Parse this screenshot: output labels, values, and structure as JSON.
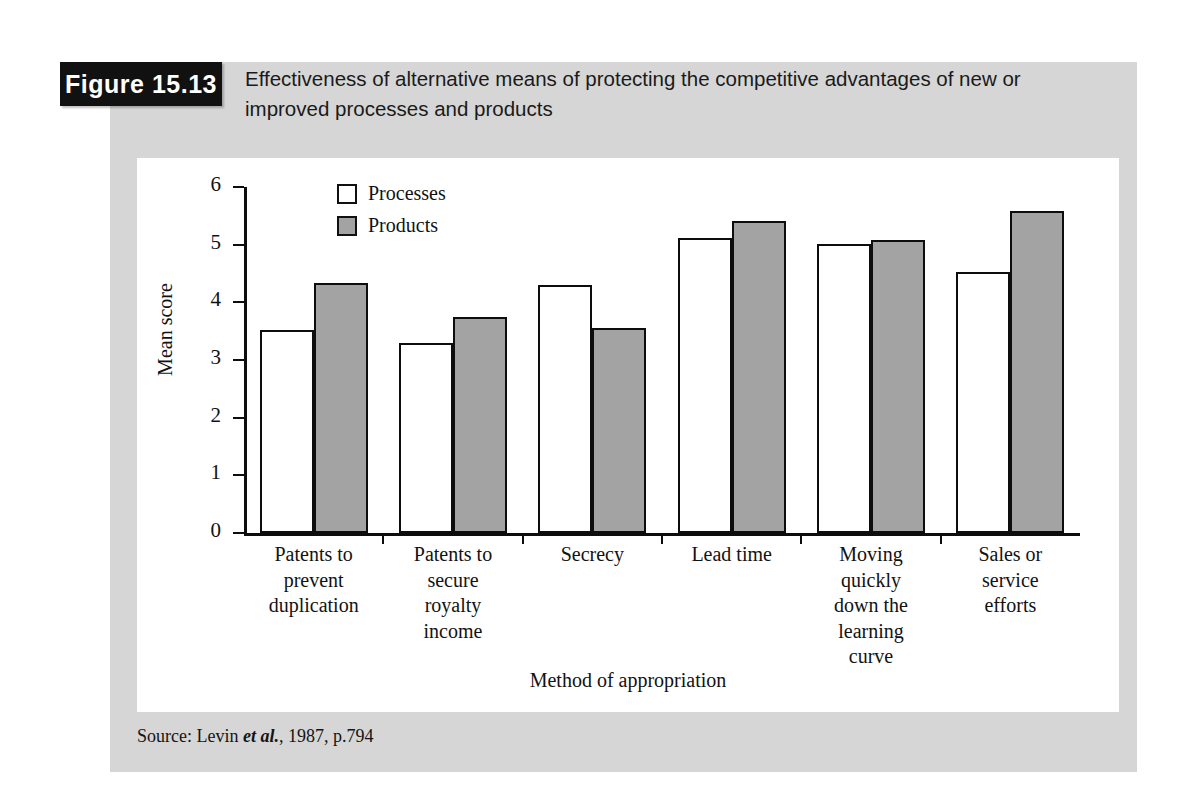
{
  "figure": {
    "number_label": "Figure 15.13",
    "caption": "Effectiveness of alternative means of protecting the competitive advantages of new or improved processes and products",
    "source_prefix": "Source: Levin ",
    "source_italic": "et al.",
    "source_suffix": ", 1987, p.794"
  },
  "colors": {
    "figure_background": "#d6d6d6",
    "panel_background": "#ffffff",
    "tab_background": "#111111",
    "tab_text": "#ffffff",
    "processes_fill": "#ffffff",
    "products_fill": "#a3a3a3",
    "bar_outline": "#0d0d0d",
    "axis": "#0d0d0d",
    "text": "#121212"
  },
  "chart_data": {
    "type": "bar",
    "title": "Effectiveness of alternative means of protecting the competitive advantages of new or improved processes and products",
    "xlabel": "Method of appropriation",
    "ylabel": "Mean score",
    "ylim": [
      0,
      6
    ],
    "yticks": [
      0,
      1,
      2,
      3,
      4,
      5,
      6
    ],
    "ytick_labels": [
      "0",
      "1",
      "2",
      "3",
      "4",
      "5",
      "6"
    ],
    "grid": false,
    "legend_position": "top-left-inside",
    "categories": [
      "Patents to prevent duplication",
      "Patents to secure royalty income",
      "Secrecy",
      "Lead time",
      "Moving quickly down the learning curve",
      "Sales or service efforts"
    ],
    "category_lines": [
      [
        "Patents to",
        "prevent",
        "duplication"
      ],
      [
        "Patents to",
        "secure",
        "royalty",
        "income"
      ],
      [
        "Secrecy"
      ],
      [
        "Lead time"
      ],
      [
        "Moving",
        "quickly",
        "down the",
        "learning",
        "curve"
      ],
      [
        "Sales or",
        "service",
        "efforts"
      ]
    ],
    "series": [
      {
        "name": "Processes",
        "values": [
          3.52,
          3.3,
          4.3,
          5.11,
          5.02,
          4.53
        ]
      },
      {
        "name": "Products",
        "values": [
          4.34,
          3.74,
          3.55,
          5.41,
          5.08,
          5.59
        ]
      }
    ]
  }
}
